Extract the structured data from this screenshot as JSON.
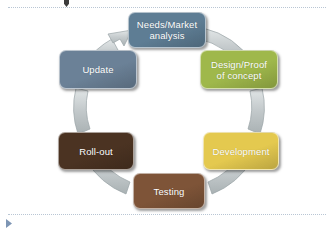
{
  "document": {
    "type": "cyclical-process-diagram",
    "placeholder_top_marker": "drag-handle",
    "placeholder_bottom_marker": "play-triangle"
  },
  "diagram": {
    "title": "",
    "direction": "clockwise",
    "connector_color": "#c3c9cb",
    "nodes": [
      {
        "id": "needs",
        "label": "Needs/Market analysis",
        "line1": "Needs/Market",
        "line2": "analysis",
        "color": "#5e7d94",
        "position": "top"
      },
      {
        "id": "design",
        "label": "Design/Proof of concept",
        "line1": "Design/Proof",
        "line2": "of concept",
        "color": "#9fb84b",
        "position": "top-right"
      },
      {
        "id": "development",
        "label": "Development",
        "line1": "Development",
        "line2": "",
        "color": "#e4c94f",
        "position": "bottom-right"
      },
      {
        "id": "testing",
        "label": "Testing",
        "line1": "Testing",
        "line2": "",
        "color": "#7e5438",
        "position": "bottom"
      },
      {
        "id": "rollout",
        "label": "Roll-out",
        "line1": "Roll-out",
        "line2": "",
        "color": "#4b3322",
        "position": "bottom-left"
      },
      {
        "id": "update",
        "label": "Update",
        "line1": "Update",
        "line2": "",
        "color": "#6b8197",
        "position": "top-left"
      }
    ]
  }
}
